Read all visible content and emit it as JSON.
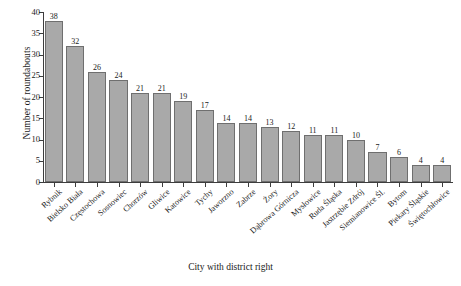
{
  "chart_data": {
    "type": "bar",
    "title": "",
    "xlabel": "City with district right",
    "ylabel": "Number of roundabouts",
    "ylim": [
      0,
      40
    ],
    "ytick_labels": [
      "0",
      "5",
      "10",
      "15",
      "20",
      "25",
      "30",
      "35",
      "40"
    ],
    "ytick_values": [
      0,
      5,
      10,
      15,
      20,
      25,
      30,
      35,
      40
    ],
    "grid": false,
    "legend": false,
    "bar_color": "#a9a9a9",
    "bar_edge_color": "#6f6f6f",
    "show_value_labels": true,
    "categories": [
      "Rybnik",
      "Bielsko Biała",
      "Częstochowa",
      "Sosnowiec",
      "Chorzów",
      "Gliwice",
      "Katowice",
      "Tychy",
      "Jaworzno",
      "Zabrze",
      "Żory",
      "Dąbrowa Górnicza",
      "Mysłowice",
      "Ruda Śląska",
      "Jastrzębie Zdrój",
      "Siemianowice Śl.",
      "Bytom",
      "Piekary Śląskie",
      "Świętochłowice"
    ],
    "values": [
      38,
      32,
      26,
      24,
      21,
      21,
      19,
      17,
      14,
      14,
      13,
      12,
      11,
      11,
      10,
      7,
      6,
      4,
      4
    ]
  }
}
